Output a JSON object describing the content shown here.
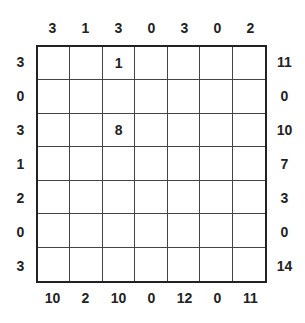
{
  "puzzle": {
    "size": 7,
    "top_clues": [
      "3",
      "1",
      "3",
      "0",
      "3",
      "0",
      "2"
    ],
    "bottom_clues": [
      "10",
      "2",
      "10",
      "0",
      "12",
      "0",
      "11"
    ],
    "left_clues": [
      "3",
      "0",
      "3",
      "1",
      "2",
      "0",
      "3"
    ],
    "right_clues": [
      "11",
      "0",
      "10",
      "7",
      "3",
      "0",
      "14"
    ],
    "cells": [
      [
        "",
        "",
        "1",
        "",
        "",
        "",
        ""
      ],
      [
        "",
        "",
        "",
        "",
        "",
        "",
        ""
      ],
      [
        "",
        "",
        "8",
        "",
        "",
        "",
        ""
      ],
      [
        "",
        "",
        "",
        "",
        "",
        "",
        ""
      ],
      [
        "",
        "",
        "",
        "",
        "",
        "",
        ""
      ],
      [
        "",
        "",
        "",
        "",
        "",
        "",
        ""
      ],
      [
        "",
        "",
        "",
        "",
        "",
        "",
        ""
      ]
    ]
  }
}
